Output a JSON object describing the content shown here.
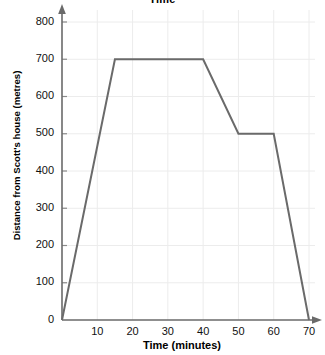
{
  "chart_data": {
    "type": "line",
    "title": "Time",
    "title_note": "title is clipped by the top edge of the screenshot",
    "xlabel": "Time (minutes)",
    "ylabel": "Distance from Scott's house (metres)",
    "xlim": [
      0,
      70
    ],
    "ylim": [
      0,
      800
    ],
    "xticks": [
      0,
      10,
      20,
      30,
      40,
      50,
      60,
      70
    ],
    "xtick_labels": [
      "0",
      "10",
      "20",
      "30",
      "40",
      "50",
      "60",
      "70"
    ],
    "yticks": [
      0,
      100,
      200,
      300,
      400,
      500,
      600,
      700,
      800
    ],
    "ytick_labels": [
      "0",
      "100",
      "200",
      "300",
      "400",
      "500",
      "600",
      "700",
      "800"
    ],
    "grid": true,
    "grid_color": "#ececec",
    "legend": false,
    "axis_arrows": true,
    "series": [
      {
        "name": "Scott's journey",
        "color": "#6a6a6a",
        "line_width": 2,
        "markers": false,
        "x": [
          0,
          15,
          40,
          50,
          60,
          70
        ],
        "y": [
          0,
          700,
          700,
          500,
          500,
          0
        ],
        "points": [
          {
            "x": 0,
            "y": 0,
            "label": "start at home"
          },
          {
            "x": 15,
            "y": 700,
            "label": "reaches 700 m"
          },
          {
            "x": 40,
            "y": 700,
            "label": "end of stop at 700 m"
          },
          {
            "x": 50,
            "y": 500,
            "label": "reaches 500 m"
          },
          {
            "x": 60,
            "y": 500,
            "label": "end of stop at 500 m"
          },
          {
            "x": 70,
            "y": 0,
            "label": "back home"
          }
        ]
      }
    ]
  },
  "colors": {
    "line": "#6a6a6a",
    "axis": "#6a6a6a",
    "grid": "#ececec",
    "text": "#111111",
    "background": "#ffffff"
  }
}
